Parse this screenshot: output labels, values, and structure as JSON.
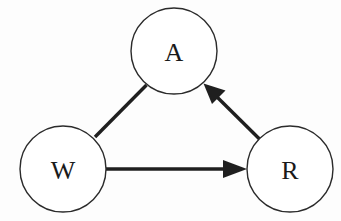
{
  "diagram": {
    "background_color": "#fdfdfd",
    "stroke_color": "#1f1f1f",
    "node_fill": "#ffffff",
    "node_stroke": "#2b2b2b",
    "label_color": "#1a1a1a",
    "nodes": [
      {
        "id": "A",
        "label": "A",
        "cx": 174,
        "cy": 51,
        "r": 43
      },
      {
        "id": "W",
        "label": "W",
        "cx": 63,
        "cy": 169,
        "r": 43
      },
      {
        "id": "R",
        "label": "R",
        "cx": 290,
        "cy": 169,
        "r": 43
      }
    ],
    "edges": [
      {
        "id": "W-A",
        "from": "W",
        "to": "A",
        "arrow": "none",
        "x1": 95,
        "y1": 137,
        "x2": 146,
        "y2": 85
      },
      {
        "id": "W-R",
        "from": "W",
        "to": "R",
        "arrow": "to",
        "x1": 106,
        "y1": 169,
        "x2": 247,
        "y2": 169
      },
      {
        "id": "R-A",
        "from": "R",
        "to": "A",
        "arrow": "to",
        "x1": 262,
        "y1": 141,
        "x2": 204,
        "y2": 84
      }
    ]
  }
}
